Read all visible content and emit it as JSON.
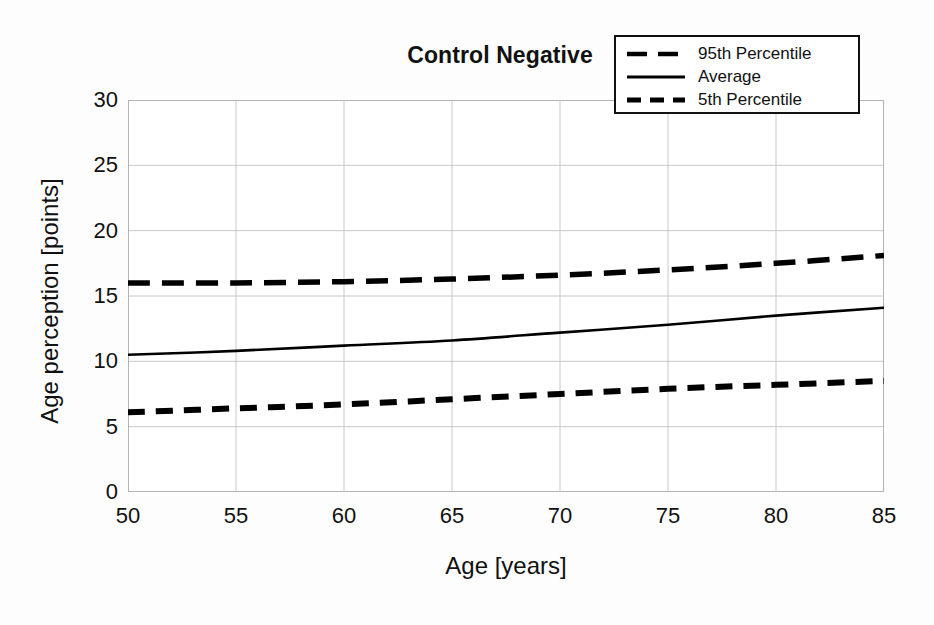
{
  "chart_data": {
    "type": "line",
    "title": "Control Negative",
    "xlabel": "Age [years]",
    "ylabel": "Age perception [points]",
    "xlim": [
      50,
      85
    ],
    "ylim": [
      0,
      30
    ],
    "xticks": [
      50,
      55,
      60,
      65,
      70,
      75,
      80,
      85
    ],
    "yticks": [
      0,
      5,
      10,
      15,
      20,
      25,
      30
    ],
    "grid": true,
    "legend_position": "top-right",
    "x": [
      50,
      55,
      60,
      65,
      70,
      75,
      80,
      85
    ],
    "series": [
      {
        "name": "95th Percentile",
        "style": "dashed",
        "color": "#000000",
        "values": [
          16.0,
          16.0,
          16.1,
          16.3,
          16.6,
          17.0,
          17.5,
          18.1
        ]
      },
      {
        "name": "Average",
        "style": "solid",
        "color": "#000000",
        "values": [
          10.5,
          10.8,
          11.2,
          11.6,
          12.2,
          12.8,
          13.5,
          14.1
        ]
      },
      {
        "name": "5th Percentile",
        "style": "dashed",
        "color": "#000000",
        "values": [
          6.1,
          6.4,
          6.7,
          7.1,
          7.5,
          7.9,
          8.2,
          8.5
        ]
      }
    ]
  },
  "title": {
    "text": "Control Negative"
  },
  "axes": {
    "x_title": "Age [years]",
    "y_title": "Age perception [points]",
    "x_tick_labels": [
      "50",
      "55",
      "60",
      "65",
      "70",
      "75",
      "80",
      "85"
    ],
    "y_tick_labels": [
      "30",
      "25",
      "20",
      "15",
      "10",
      "5",
      "0"
    ]
  },
  "legend": {
    "items": [
      {
        "label": "95th Percentile",
        "style": "dashed"
      },
      {
        "label": "Average",
        "style": "solid"
      },
      {
        "label": "5th Percentile",
        "style": "dashed"
      }
    ]
  },
  "colors": {
    "line": "#000000",
    "grid": "#c8c8c8",
    "axis": "#b0b0b0",
    "background": "#fdfdfd",
    "text": "#111111"
  }
}
